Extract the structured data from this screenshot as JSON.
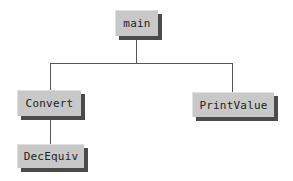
{
  "diagram": {
    "type": "structure-chart",
    "nodes": [
      {
        "id": "main",
        "label": "main"
      },
      {
        "id": "convert",
        "label": "Convert"
      },
      {
        "id": "printvalue",
        "label": "PrintValue"
      },
      {
        "id": "decequiv",
        "label": "DecEquiv"
      }
    ],
    "edges": [
      {
        "from": "main",
        "to": "convert"
      },
      {
        "from": "main",
        "to": "printvalue"
      },
      {
        "from": "convert",
        "to": "decequiv"
      }
    ]
  }
}
